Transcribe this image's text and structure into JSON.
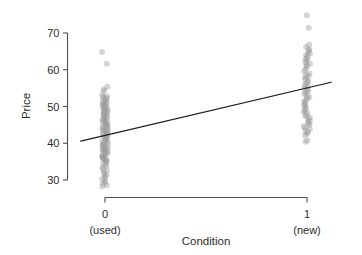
{
  "chart_data": {
    "type": "scatter",
    "title": "",
    "xlabel": "Condition",
    "ylabel": "Price",
    "grid": false,
    "legend": false,
    "xlim": [
      -0.12,
      1.12
    ],
    "ylim": [
      27,
      76
    ],
    "x_ticks": [
      {
        "value": 0,
        "label": "0",
        "sublabel": "(used)"
      },
      {
        "value": 1,
        "label": "1",
        "sublabel": "(new)"
      }
    ],
    "y_ticks": [
      {
        "value": 30,
        "label": "30"
      },
      {
        "value": 40,
        "label": "40"
      },
      {
        "value": 50,
        "label": "50"
      },
      {
        "value": 60,
        "label": "60"
      },
      {
        "value": 70,
        "label": "70"
      }
    ],
    "fit_line": {
      "name": "regression line",
      "x_start": -0.12,
      "y_start": 40.6,
      "x_end": 1.12,
      "y_end": 56.6,
      "intercept": 42.2,
      "slope": 12.9
    },
    "series": [
      {
        "name": "used (Condition = 0)",
        "x": 0,
        "marker": "circle",
        "color": "#9a9a9a",
        "opacity": 0.42,
        "values": [
          64.8,
          61.6,
          55.4,
          54.6,
          54.2,
          53.2,
          52.8,
          52.6,
          52.4,
          52.2,
          52.0,
          51.6,
          51.4,
          51.2,
          51.0,
          50.8,
          50.6,
          50.4,
          50.2,
          50.0,
          49.8,
          49.6,
          49.4,
          49.2,
          49.0,
          48.8,
          48.6,
          48.4,
          48.2,
          48.0,
          47.8,
          47.6,
          47.4,
          47.2,
          47.0,
          46.8,
          46.6,
          46.4,
          46.2,
          46.0,
          45.8,
          45.6,
          45.4,
          45.2,
          45.0,
          44.8,
          44.6,
          44.4,
          44.2,
          44.0,
          43.8,
          43.6,
          43.4,
          43.2,
          43.0,
          42.8,
          42.6,
          42.4,
          42.2,
          42.0,
          41.8,
          41.6,
          41.4,
          41.2,
          41.0,
          40.8,
          40.6,
          40.4,
          40.2,
          40.0,
          39.8,
          39.6,
          39.4,
          39.2,
          39.0,
          38.8,
          38.6,
          38.4,
          38.2,
          38.0,
          37.8,
          37.6,
          37.4,
          37.2,
          37.0,
          36.8,
          36.6,
          36.4,
          36.2,
          36.0,
          35.8,
          35.6,
          35.4,
          35.2,
          35.0,
          34.6,
          34.2,
          33.8,
          33.4,
          33.0,
          32.6,
          32.2,
          31.8,
          31.4,
          31.0,
          30.6,
          30.2,
          29.8,
          29.4,
          29.0,
          28.6,
          28.2
        ]
      },
      {
        "name": "new (Condition = 1)",
        "x": 1,
        "marker": "circle",
        "color": "#9a9a9a",
        "opacity": 0.42,
        "values": [
          74.8,
          71.4,
          66.8,
          66.2,
          65.6,
          65.2,
          64.8,
          64.4,
          64.0,
          63.6,
          63.2,
          62.8,
          62.4,
          62.0,
          61.6,
          61.2,
          60.8,
          60.2,
          59.6,
          59.0,
          58.6,
          58.2,
          57.8,
          57.4,
          57.0,
          56.6,
          56.2,
          55.8,
          55.4,
          55.0,
          54.6,
          54.2,
          53.8,
          53.4,
          53.0,
          52.6,
          52.2,
          51.8,
          51.4,
          51.0,
          50.6,
          50.2,
          49.8,
          49.4,
          49.0,
          48.6,
          48.2,
          47.8,
          47.4,
          47.0,
          46.6,
          46.2,
          45.8,
          45.4,
          45.0,
          44.6,
          44.2,
          43.8,
          43.4,
          43.0,
          42.6,
          42.2,
          40.8,
          40.4
        ]
      }
    ]
  }
}
